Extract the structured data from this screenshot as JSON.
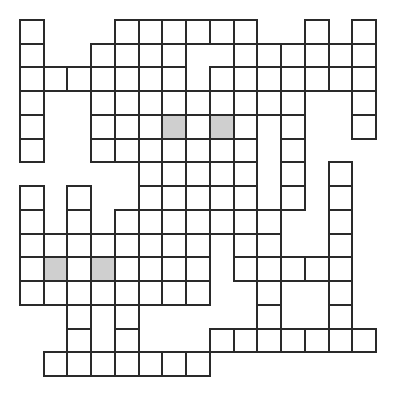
{
  "puzzle": {
    "type": "crossword-grid",
    "rows": 15,
    "cols": 15,
    "colors": {
      "border": "#2a2a2a",
      "cell": "#ffffff",
      "shaded": "#cfcfcf"
    },
    "cells": [
      [
        0,
        [
          0,
          4,
          5,
          6,
          7,
          8,
          9,
          12,
          14
        ]
      ],
      [
        1,
        [
          0,
          3,
          4,
          5,
          6,
          9,
          10,
          11,
          12,
          13,
          14
        ]
      ],
      [
        2,
        [
          0,
          1,
          2,
          3,
          4,
          5,
          6,
          8,
          9,
          10,
          11,
          12,
          13,
          14
        ]
      ],
      [
        3,
        [
          0,
          3,
          4,
          5,
          6,
          7,
          8,
          9,
          10,
          11,
          14
        ]
      ],
      [
        4,
        [
          0,
          3,
          5,
          6,
          7,
          8,
          9,
          11,
          14
        ]
      ],
      [
        5,
        [
          0,
          3,
          4,
          5,
          6,
          7,
          8,
          9,
          11
        ]
      ],
      [
        6,
        [
          5,
          6,
          7,
          8,
          9,
          11,
          13
        ]
      ],
      [
        7,
        [
          0,
          2,
          5,
          7,
          9,
          11,
          13
        ]
      ],
      [
        8,
        [
          0,
          2,
          4,
          5,
          6,
          7,
          8,
          9,
          10,
          13
        ]
      ],
      [
        9,
        [
          0,
          1,
          2,
          3,
          4,
          5,
          6,
          7,
          9,
          10,
          13
        ]
      ],
      [
        10,
        [
          0,
          1,
          2,
          3,
          4,
          5,
          6,
          7,
          9,
          10,
          11,
          12,
          13
        ]
      ],
      [
        11,
        [
          0,
          1,
          2,
          3,
          4,
          5,
          6,
          7,
          10,
          13
        ]
      ],
      [
        12,
        [
          2,
          4,
          10,
          13
        ]
      ],
      [
        13,
        [
          2,
          4,
          8,
          9,
          10,
          11,
          12,
          13,
          14
        ]
      ],
      [
        14,
        [
          1,
          2,
          3,
          4,
          5,
          6,
          7
        ]
      ]
    ],
    "shaded": [
      [
        4,
        6
      ],
      [
        4,
        8
      ],
      [
        10,
        1
      ],
      [
        10,
        3
      ]
    ]
  }
}
